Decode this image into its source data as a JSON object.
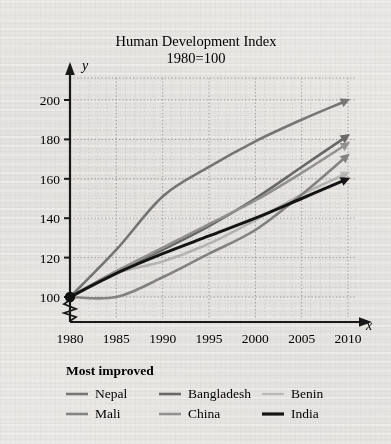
{
  "chart_data": {
    "type": "line",
    "title": "Human Development Index",
    "subtitle": "1980=100",
    "xlabel": "x",
    "ylabel": "y",
    "xlim": [
      1980,
      2010
    ],
    "ylim": [
      100,
      200
    ],
    "yaxis_break": true,
    "grid": true,
    "x": [
      1980,
      1985,
      1990,
      1995,
      2000,
      2005,
      2010
    ],
    "xticklabels": [
      "1980",
      "1985",
      "1990",
      "1995",
      "2000",
      "2005",
      "2010"
    ],
    "yticklabels": [
      "100",
      "120",
      "140",
      "160",
      "180",
      "200"
    ],
    "yticks": [
      100,
      120,
      140,
      160,
      180,
      200
    ],
    "origin_marker": {
      "x": 1980,
      "y": 100,
      "label": "1980=100"
    },
    "legend_position": "below",
    "legend_title": "Most improved",
    "series": [
      {
        "name": "Nepal",
        "color": "#7c7c7c",
        "width": 2.6,
        "arrow": true,
        "values": [
          100,
          124,
          151,
          166,
          179,
          190,
          200
        ]
      },
      {
        "name": "Bangladesh",
        "color": "#6e6e6e",
        "width": 2.6,
        "arrow": true,
        "values": [
          100,
          113,
          124,
          136,
          150,
          166,
          182
        ]
      },
      {
        "name": "Benin",
        "color": "#c0c0c0",
        "width": 2.6,
        "arrow": true,
        "values": [
          100,
          112,
          118,
          127,
          139,
          152,
          163
        ]
      },
      {
        "name": "Mali",
        "color": "#8a8a8a",
        "width": 2.6,
        "arrow": true,
        "values": [
          100,
          100,
          110,
          122,
          134,
          152,
          172
        ]
      },
      {
        "name": "China",
        "color": "#9a9a9a",
        "width": 2.6,
        "arrow": true,
        "values": [
          100,
          113,
          125,
          137,
          149,
          163,
          178
        ]
      },
      {
        "name": "India",
        "color": "#151515",
        "width": 3.0,
        "arrow": true,
        "values": [
          100,
          112,
          122,
          131,
          140,
          150,
          160
        ]
      }
    ]
  },
  "legend": {
    "title": "Most improved",
    "rows": [
      [
        {
          "label": "Nepal",
          "color": "#7c7c7c",
          "width": 2.6
        },
        {
          "label": "Bangladesh",
          "color": "#6e6e6e",
          "width": 2.6
        },
        {
          "label": "Benin",
          "color": "#c6c6c6",
          "width": 2.2
        }
      ],
      [
        {
          "label": "Mali",
          "color": "#8a8a8a",
          "width": 2.6
        },
        {
          "label": "China",
          "color": "#9a9a9a",
          "width": 2.6
        },
        {
          "label": "India",
          "color": "#151515",
          "width": 3.2
        }
      ]
    ]
  }
}
